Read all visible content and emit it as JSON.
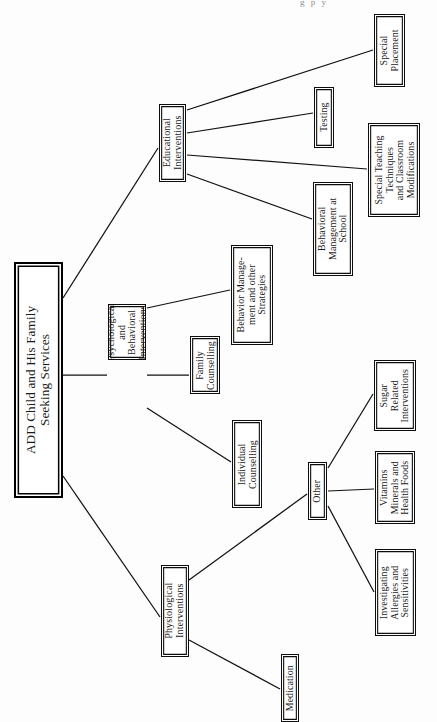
{
  "page": {
    "header_fragment": "g  p y",
    "orientation": "rotated-90-ccw",
    "ink_color": "#111111",
    "paper_color": "#fdfdfd"
  },
  "diagram": {
    "type": "tree",
    "title": "ADD Child and His Family Seeking Services",
    "nodes": [
      {
        "id": "root",
        "label": "ADD Child and His Family\nSeeking Services",
        "level": 0,
        "style": "root",
        "x": 14,
        "y": 262,
        "w": 49,
        "h": 236
      },
      {
        "id": "educational",
        "label": "Educational\nInterventions",
        "level": 1,
        "style": "strong",
        "x": 159,
        "y": 104,
        "w": 27,
        "h": 78
      },
      {
        "id": "psychological",
        "label": "Psychological\nand\nBehavioral\nInterventions",
        "level": 1,
        "style": "strong",
        "x": 108,
        "y": 304,
        "w": 38,
        "h": 56
      },
      {
        "id": "physiological",
        "label": "Physiological\nInterventions",
        "level": 1,
        "style": "strong",
        "x": 161,
        "y": 565,
        "w": 28,
        "h": 92
      },
      {
        "id": "special-placement",
        "label": "Special\nPlacement",
        "level": 2,
        "style": "strong",
        "x": 374,
        "y": 14,
        "w": 31,
        "h": 73
      },
      {
        "id": "testing",
        "label": "Testing",
        "level": 2,
        "style": "strong",
        "x": 314,
        "y": 87,
        "w": 20,
        "h": 61
      },
      {
        "id": "special-teaching",
        "label": "Special Teaching\nTechniques\nand Classroom\nModifications",
        "level": 2,
        "style": "strong",
        "x": 368,
        "y": 123,
        "w": 52,
        "h": 94
      },
      {
        "id": "behavioral-school",
        "label": "Behavioral\nManagement at\nSchool",
        "level": 2,
        "style": "strong",
        "x": 313,
        "y": 182,
        "w": 40,
        "h": 94
      },
      {
        "id": "behavior-strategies",
        "label": "Behavior Manage-\nment and other\nStrategies",
        "level": 2,
        "style": "strong",
        "x": 231,
        "y": 245,
        "w": 42,
        "h": 100
      },
      {
        "id": "family-counselling",
        "label": "Family\nCounselling",
        "level": 2,
        "style": "strong",
        "x": 190,
        "y": 336,
        "w": 30,
        "h": 58
      },
      {
        "id": "individual-counselling",
        "label": "Individual\nCounselling",
        "level": 2,
        "style": "strong",
        "x": 232,
        "y": 420,
        "w": 30,
        "h": 88
      },
      {
        "id": "other",
        "label": "Other",
        "level": 2,
        "style": "strong",
        "x": 308,
        "y": 462,
        "w": 19,
        "h": 58
      },
      {
        "id": "medication",
        "label": "Medication",
        "level": 2,
        "style": "strong",
        "x": 281,
        "y": 654,
        "w": 18,
        "h": 68
      },
      {
        "id": "sugar",
        "label": "Sugar\nRelated\nInterventions",
        "level": 3,
        "style": "strong",
        "x": 374,
        "y": 360,
        "w": 42,
        "h": 71
      },
      {
        "id": "vitamins",
        "label": "Vitamins\nMinerals and\nHealth Foods",
        "level": 3,
        "style": "strong",
        "x": 375,
        "y": 451,
        "w": 40,
        "h": 73
      },
      {
        "id": "allergies",
        "label": "Investigating\nAllergies and\nSensitivities",
        "level": 3,
        "style": "strong",
        "x": 375,
        "y": 549,
        "w": 41,
        "h": 87
      }
    ],
    "edges": [
      {
        "from": "root",
        "to": "educational",
        "x1": 63,
        "y1": 298,
        "x2": 158,
        "y2": 148
      },
      {
        "from": "root",
        "to": "psychological",
        "x1": 63,
        "y1": 375,
        "x2": 107,
        "y2": 375
      },
      {
        "from": "root",
        "to": "physiological",
        "x1": 63,
        "y1": 476,
        "x2": 160,
        "y2": 617
      },
      {
        "from": "educational",
        "to": "special-placement",
        "x1": 187,
        "y1": 110,
        "x2": 373,
        "y2": 50
      },
      {
        "from": "educational",
        "to": "testing",
        "x1": 187,
        "y1": 133,
        "x2": 313,
        "y2": 113
      },
      {
        "from": "educational",
        "to": "special-teaching",
        "x1": 187,
        "y1": 155,
        "x2": 367,
        "y2": 169
      },
      {
        "from": "educational",
        "to": "behavioral-school",
        "x1": 187,
        "y1": 174,
        "x2": 312,
        "y2": 219
      },
      {
        "from": "psychological",
        "to": "behavior-strategies",
        "x1": 147,
        "y1": 308,
        "x2": 230,
        "y2": 290
      },
      {
        "from": "psychological",
        "to": "family-counselling",
        "x1": 147,
        "y1": 375,
        "x2": 189,
        "y2": 375
      },
      {
        "from": "psychological",
        "to": "individual-counselling",
        "x1": 147,
        "y1": 408,
        "x2": 231,
        "y2": 462
      },
      {
        "from": "physiological",
        "to": "other",
        "x1": 189,
        "y1": 580,
        "x2": 307,
        "y2": 494
      },
      {
        "from": "physiological",
        "to": "medication",
        "x1": 189,
        "y1": 640,
        "x2": 280,
        "y2": 689
      },
      {
        "from": "other",
        "to": "sugar",
        "x1": 328,
        "y1": 468,
        "x2": 373,
        "y2": 394
      },
      {
        "from": "other",
        "to": "vitamins",
        "x1": 328,
        "y1": 491,
        "x2": 374,
        "y2": 489
      },
      {
        "from": "other",
        "to": "allergies",
        "x1": 328,
        "y1": 506,
        "x2": 374,
        "y2": 592
      }
    ]
  }
}
